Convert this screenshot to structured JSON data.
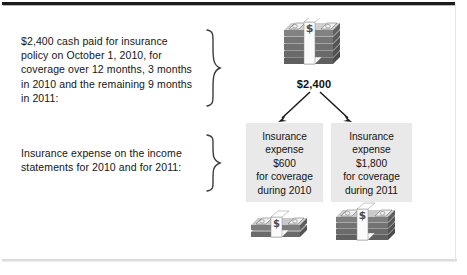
{
  "figure": {
    "background": "#ffffff",
    "frame_color": "#1c1c1c",
    "box_fill": "#e9e9e9",
    "text_color": "#151515"
  },
  "captions": {
    "top": "$2,400 cash paid for insurance\npolicy on October 1, 2010, for\ncoverage over 12 months, 3 months\nin 2010 and the remaining 9 months\nin 2011:",
    "bottom": "Insurance expense on the income\nstatements for 2010 and for 2011:"
  },
  "cash": {
    "total_label": "$2,400",
    "top_stack_name": "cash-stack-2400",
    "left_stack_name": "cash-stack-600",
    "right_stack_name": "cash-stack-1800"
  },
  "braces": {
    "top_name": "curly-brace-top",
    "bottom_name": "curly-brace-bottom"
  },
  "arrows": {
    "left_name": "arrow-to-2010",
    "right_name": "arrow-to-2011"
  },
  "boxes": [
    {
      "id": "box-2010",
      "text": "Insurance\nexpense\n$600\nfor coverage\nduring 2010",
      "amount": "$600",
      "year": "2010"
    },
    {
      "id": "box-2011",
      "text": "Insurance\nexpense\n$1,800\nfor coverage\nduring 2011",
      "amount": "$1,800",
      "year": "2011"
    }
  ]
}
